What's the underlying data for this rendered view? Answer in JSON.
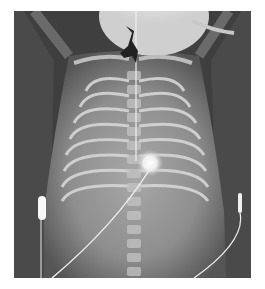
{
  "image": {
    "type": "radiograph",
    "description": "Frontal chest X-ray of an infant with ECG leads and a line",
    "colors": {
      "background": "#ffffff",
      "film_dark": "#3a3a3a",
      "tissue": "#8a8a8a",
      "bone": "#d8d8d8",
      "bright": "#f4f4f4"
    },
    "elements": [
      "ribcage",
      "spine",
      "clavicles",
      "ecg-lead-left",
      "ecg-lead-right",
      "central-line",
      "tracheal-tube-clip",
      "ecg-electrode-center"
    ]
  }
}
